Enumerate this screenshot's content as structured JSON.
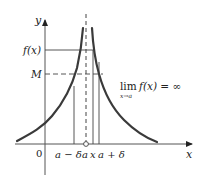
{
  "diagram": {
    "colors": {
      "curve": "#3a3a3a",
      "axis": "#555555",
      "lines": "#444444",
      "text": "#222222",
      "background": "#ffffff"
    },
    "axes": {
      "x_label": "x",
      "y_label": "y",
      "origin_label": "0"
    },
    "y_labels": {
      "fx": "f(x)",
      "M": "M"
    },
    "x_labels": {
      "a_minus_delta": "a − δ",
      "a": "a",
      "x": "x",
      "a_plus_delta": "a + δ"
    },
    "annotation": {
      "lim": "lim",
      "sub": "x→a",
      "expr": "f(x) = ∞"
    },
    "elements": [
      {
        "type": "vertical-asymptote",
        "style": "dashed",
        "at": "a"
      },
      {
        "type": "horizontal-line",
        "label": "f(x)",
        "style": "solid"
      },
      {
        "type": "horizontal-line",
        "label": "M",
        "style": "dashed"
      },
      {
        "type": "vertical-line",
        "label": "a − δ"
      },
      {
        "type": "vertical-line",
        "label": "x"
      },
      {
        "type": "vertical-line",
        "label": "a + δ"
      },
      {
        "type": "curve",
        "side": "left",
        "behavior": "increases to +∞ as x→a⁻"
      },
      {
        "type": "curve",
        "side": "right",
        "behavior": "decreases from +∞ as x→a⁺"
      },
      {
        "type": "open-point",
        "at": "(a, 0)"
      }
    ]
  }
}
